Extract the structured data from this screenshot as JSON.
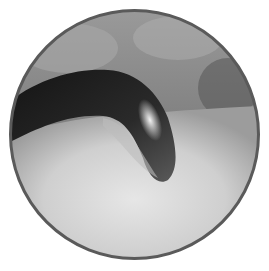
{
  "image": {
    "description": "Circular grayscale endoscopic/arthroscopic view showing a dark curved tubular structure over a pale smooth surface",
    "shape": "circle",
    "colors": {
      "border": "#5a5a5a",
      "background_top": "#8a8a8a",
      "tissue_light": "#d8d8d8",
      "structure_dark": "#1e1e1e",
      "highlight": "#f2f2f2"
    }
  }
}
